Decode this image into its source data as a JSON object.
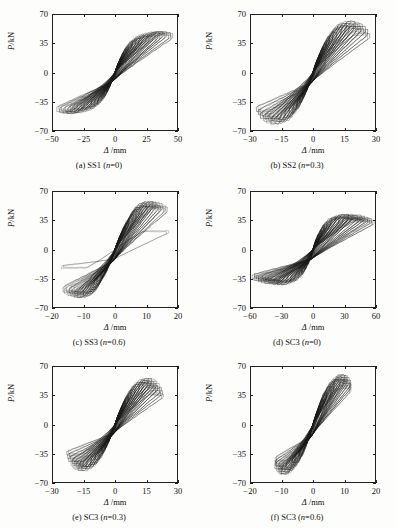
{
  "figure": {
    "axis_labels": {
      "x": "/mm",
      "x_symbol": "Δ",
      "y": "/kN",
      "y_symbol": "P"
    },
    "style": {
      "line_color": "#1a1a1a",
      "frame_color": "#222222",
      "background": "#fdfdfb"
    }
  },
  "chart_data": [
    {
      "id": "a",
      "type": "line",
      "title": "(a) SS1 (n=0)",
      "caption_prefix": "(a) SS1 (",
      "caption_italic": "n",
      "caption_suffix": "=0)",
      "xlabel": "Δ /mm",
      "ylabel": "P/kN",
      "xlim": [
        -50,
        50
      ],
      "ylim": [
        -70,
        70
      ],
      "xticks": [
        -50,
        -25,
        0,
        25,
        50
      ],
      "yticks": [
        -70,
        -35,
        0,
        35,
        70
      ],
      "grid": false,
      "series_description": "cyclic load-displacement hysteresis loops, pinched S-shape",
      "peak_force_pos": 48,
      "peak_force_neg": -46,
      "peak_disp_pos": 46,
      "peak_disp_neg": -45,
      "pinch_force": 14,
      "n_cycles": 17,
      "cycle_amplitudes": [
        3,
        5,
        7,
        9,
        11,
        14,
        17,
        20,
        23,
        26,
        29,
        32,
        35,
        38,
        41,
        44,
        46
      ],
      "cycle_peak_forces": [
        12,
        18,
        24,
        29,
        33,
        37,
        40,
        42,
        44,
        45,
        46,
        47,
        47,
        48,
        48,
        47,
        46
      ]
    },
    {
      "id": "b",
      "type": "line",
      "title": "(b) SS2 (n=0.3)",
      "caption_prefix": "(b) SS2 (",
      "caption_italic": "n",
      "caption_suffix": "=0.3)",
      "xlabel": "Δ /mm",
      "ylabel": "P/kN",
      "xlim": [
        -30,
        30
      ],
      "ylim": [
        -70,
        70
      ],
      "xticks": [
        -30,
        -15,
        0,
        15,
        30
      ],
      "yticks": [
        -70,
        -35,
        0,
        35,
        70
      ],
      "grid": false,
      "series_description": "cyclic load-displacement hysteresis loops, steeper narrow loops",
      "peak_force_pos": 60,
      "peak_force_neg": -52,
      "peak_disp_pos": 27,
      "peak_disp_neg": -27,
      "pinch_force": 18,
      "n_cycles": 16,
      "cycle_amplitudes": [
        2,
        3.5,
        5,
        6.5,
        8,
        10,
        12,
        14,
        16,
        18,
        20,
        22,
        23.5,
        25,
        26,
        27
      ],
      "cycle_peak_forces": [
        14,
        22,
        30,
        36,
        42,
        48,
        52,
        56,
        58,
        60,
        60,
        59,
        57,
        54,
        50,
        46
      ]
    },
    {
      "id": "c",
      "type": "line",
      "title": "(c) SS3 (n=0.6)",
      "caption_prefix": "(c) SS3 (",
      "caption_italic": "n",
      "caption_suffix": "=0.6)",
      "xlabel": "Δ /mm",
      "ylabel": "P/kN",
      "xlim": [
        -20,
        20
      ],
      "ylim": [
        -70,
        70
      ],
      "xticks": [
        -20,
        -10,
        0,
        10,
        20
      ],
      "yticks": [
        -70,
        -35,
        0,
        35,
        70
      ],
      "grid": false,
      "series_description": "cyclic hysteresis loops with one large outer cycle reaching -68 kN",
      "peak_force_pos": 56,
      "peak_force_neg": -66,
      "peak_disp_pos": 17,
      "peak_disp_neg": -14,
      "pinch_force": 20,
      "n_cycles": 17,
      "cycle_amplitudes": [
        1.5,
        2.5,
        3.5,
        4.5,
        6,
        7,
        8,
        9,
        10,
        11,
        12,
        13,
        14,
        15,
        16,
        16.5,
        17
      ],
      "cycle_peak_forces": [
        12,
        20,
        28,
        34,
        40,
        45,
        49,
        52,
        54,
        55,
        56,
        56,
        55,
        54,
        52,
        50,
        22
      ]
    },
    {
      "id": "d",
      "type": "line",
      "title": "(d) SC3 (n=0)",
      "caption_prefix": "(d) SC3 (",
      "caption_italic": "n",
      "caption_suffix": "=0)",
      "xlabel": "Δ /mm",
      "ylabel": "P/kN",
      "xlim": [
        -60,
        60
      ],
      "ylim": [
        -70,
        70
      ],
      "xticks": [
        -60,
        -30,
        0,
        30,
        60
      ],
      "yticks": [
        -70,
        -35,
        0,
        35,
        70
      ],
      "grid": false,
      "series_description": "wide flat hysteresis loops, large displacement low peak force",
      "peak_force_pos": 41,
      "peak_force_neg": -40,
      "peak_disp_pos": 58,
      "peak_disp_neg": -58,
      "pinch_force": 18,
      "n_cycles": 18,
      "cycle_amplitudes": [
        3,
        5,
        8,
        11,
        14,
        18,
        22,
        26,
        30,
        34,
        38,
        42,
        46,
        49,
        52,
        54,
        56,
        58
      ],
      "cycle_peak_forces": [
        12,
        18,
        24,
        29,
        33,
        36,
        38,
        39,
        40,
        41,
        41,
        40,
        40,
        39,
        38,
        37,
        36,
        34
      ]
    },
    {
      "id": "e",
      "type": "line",
      "title": "(e) SC3 (n=0.3)",
      "caption_prefix": "(e) SC3 (",
      "caption_italic": "n",
      "caption_suffix": "=0.3)",
      "xlabel": "Δ /mm",
      "ylabel": "P/kN",
      "xlim": [
        -30,
        30
      ],
      "ylim": [
        -70,
        70
      ],
      "xticks": [
        -30,
        -15,
        0,
        15,
        30
      ],
      "yticks": [
        -70,
        -35,
        0,
        35,
        70
      ],
      "grid": false,
      "series_description": "cyclic hysteresis loops, moderately pinched",
      "peak_force_pos": 54,
      "peak_force_neg": -52,
      "peak_disp_pos": 23,
      "peak_disp_neg": -23,
      "pinch_force": 16,
      "n_cycles": 16,
      "cycle_amplitudes": [
        2,
        3.5,
        5,
        6.5,
        8,
        10,
        12,
        14,
        16,
        17.5,
        19,
        20,
        21,
        22,
        22.5,
        23
      ],
      "cycle_peak_forces": [
        13,
        21,
        28,
        34,
        40,
        45,
        49,
        52,
        54,
        54,
        53,
        51,
        48,
        44,
        40,
        36
      ]
    },
    {
      "id": "f",
      "type": "line",
      "title": "(f) SC3 (n=0.6)",
      "caption_prefix": "(f) SC3 (",
      "caption_italic": "n",
      "caption_suffix": "=0.6)",
      "xlabel": "Δ /mm",
      "ylabel": "P/kN",
      "xlim": [
        -20,
        20
      ],
      "ylim": [
        -70,
        70
      ],
      "xticks": [
        -20,
        -10,
        0,
        10,
        20
      ],
      "yticks": [
        -70,
        -35,
        0,
        35,
        70
      ],
      "grid": false,
      "series_description": "narrow steep hysteresis loops reaching -66 kN",
      "peak_force_pos": 58,
      "peak_force_neg": -64,
      "peak_disp_pos": 12,
      "peak_disp_neg": -12,
      "pinch_force": 20,
      "n_cycles": 15,
      "cycle_amplitudes": [
        1.5,
        2.5,
        3.5,
        4.5,
        6,
        7,
        8,
        9,
        10,
        10.5,
        11,
        11.5,
        12,
        12,
        12
      ],
      "cycle_peak_forces": [
        14,
        22,
        30,
        38,
        44,
        49,
        53,
        56,
        58,
        58,
        57,
        55,
        52,
        48,
        44
      ]
    }
  ]
}
